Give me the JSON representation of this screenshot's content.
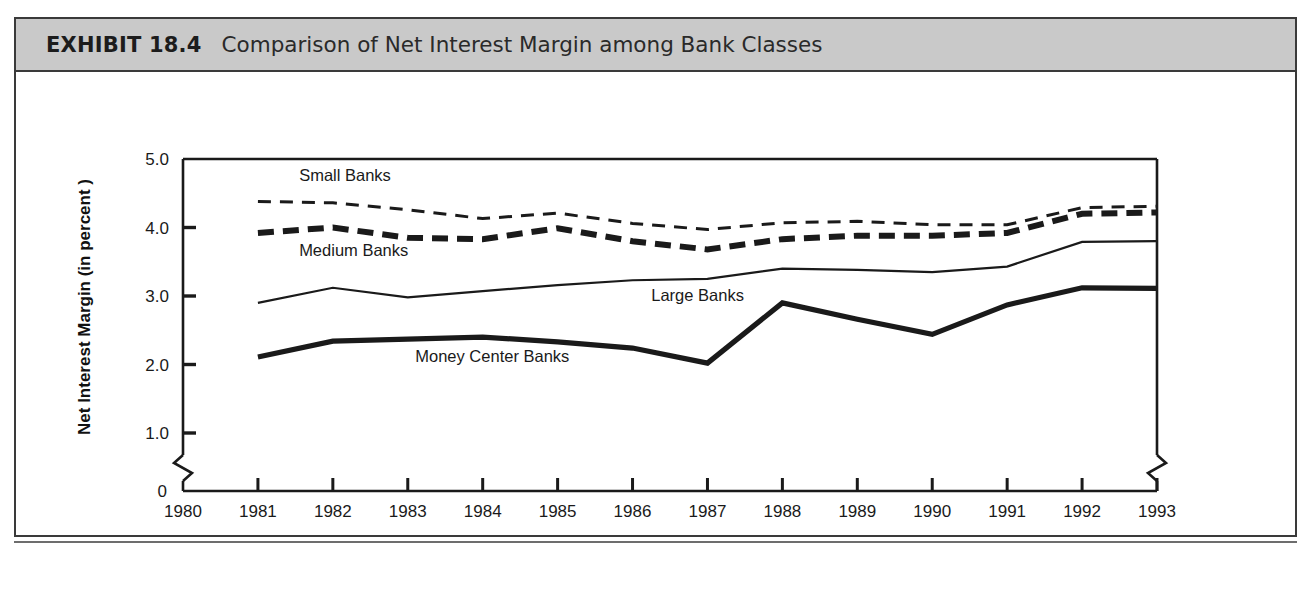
{
  "exhibit": {
    "label": "EXHIBIT 18.4",
    "title": "Comparison of Net Interest Margin among Bank Classes"
  },
  "chart_data": {
    "type": "line",
    "title": "Comparison of Net Interest Margin among Bank Classes",
    "xlabel": "Year",
    "ylabel": "Net Interest Margin (in percent )",
    "x": [
      1981,
      1982,
      1983,
      1984,
      1985,
      1986,
      1987,
      1988,
      1989,
      1990,
      1991,
      1992,
      1993
    ],
    "xtick_labels": [
      "1980",
      "1981",
      "1982",
      "1983",
      "1984",
      "1985",
      "1986",
      "1987",
      "1988",
      "1989",
      "1990",
      "1991",
      "1992",
      "1993"
    ],
    "ytick_labels": [
      "0",
      "1.0",
      "2.0",
      "3.0",
      "4.0",
      "5.0"
    ],
    "ytick_values": [
      0,
      1.0,
      2.0,
      3.0,
      4.0,
      5.0
    ],
    "ylim": [
      0,
      5.0
    ],
    "xlim": [
      1980,
      1993
    ],
    "y_axis_break": true,
    "grid": false,
    "legend_position": "inline-annotations",
    "series": [
      {
        "name": "Small Banks",
        "style": "thin-dashed",
        "label_x": 1981.55,
        "label_y": 4.68,
        "values": [
          4.38,
          4.36,
          4.26,
          4.13,
          4.21,
          4.06,
          3.97,
          4.07,
          4.09,
          4.04,
          4.04,
          4.29,
          4.31
        ]
      },
      {
        "name": "Medium Banks",
        "style": "thick-dashed",
        "label_x": 1981.55,
        "label_y": 3.58,
        "values": [
          3.92,
          4.0,
          3.85,
          3.83,
          3.99,
          3.8,
          3.68,
          3.83,
          3.88,
          3.88,
          3.92,
          4.2,
          4.22
        ]
      },
      {
        "name": "Large Banks",
        "style": "thin-solid",
        "label_x": 1986.25,
        "label_y": 2.92,
        "values": [
          2.9,
          3.12,
          2.98,
          3.07,
          3.16,
          3.23,
          3.25,
          3.4,
          3.38,
          3.35,
          3.43,
          3.79,
          3.8
        ]
      },
      {
        "name": "Money Center Banks",
        "style": "thick-solid",
        "label_x": 1983.1,
        "label_y": 2.03,
        "values": [
          2.11,
          2.34,
          2.37,
          2.4,
          2.33,
          2.24,
          2.02,
          2.9,
          2.66,
          2.44,
          2.87,
          3.12,
          3.11
        ]
      }
    ]
  }
}
